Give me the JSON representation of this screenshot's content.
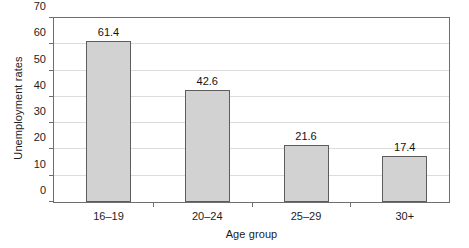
{
  "chart_data": {
    "type": "bar",
    "title": "",
    "subtitle": "",
    "xlabel": "Age group",
    "ylabel": "Unemployment rates",
    "categories": [
      "16–19",
      "20–24",
      "25–29",
      "30+"
    ],
    "values": [
      61.4,
      42.6,
      21.6,
      17.4
    ],
    "value_labels": [
      "61.4",
      "42.6",
      "21.6",
      "17.4"
    ],
    "ylim": [
      0,
      70
    ],
    "ytick_values": [
      0,
      10,
      20,
      30,
      40,
      50,
      60,
      70
    ],
    "ytick_labels": [
      "0",
      "10",
      "20",
      "30",
      "40",
      "50",
      "60",
      "70"
    ],
    "grid": "horizontal",
    "legend": "none",
    "bar_fill_color": "#d2d2d2",
    "bar_border_color": "#5d5d5d",
    "gridline_color": "#dcdcdc",
    "axis_color": "#6e6e6e",
    "background_color": "#ffffff",
    "annotations": []
  }
}
